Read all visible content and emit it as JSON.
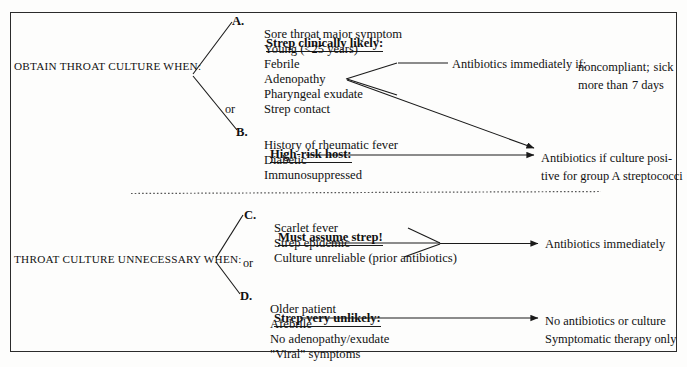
{
  "diagram": {
    "type": "clinical-decision-flowchart",
    "title_visible": false,
    "colors": {
      "ink": "#111111",
      "frame": "#2b2b2b",
      "background": "#fdfdfc",
      "divider": "#555555"
    },
    "left_labels": {
      "top": "OBTAIN THROAT CULTURE WHEN:",
      "bottom": "THROAT CULTURE UNNECESSARY WHEN:"
    },
    "connector_words": {
      "top_or": "or",
      "bottom_or": "or"
    },
    "groups": [
      {
        "id": "A",
        "letter": "A.",
        "heading": "Strep clinically likely:",
        "items": [
          "Sore throat major symptom",
          "Young (<25 years)",
          "Febrile",
          "Adenopathy",
          "Pharyngeal exudate",
          "Strep contact"
        ],
        "outcome_lines": [
          "Antibiotics immediately if:",
          "noncompliant;",
          "sick more than",
          "7 days"
        ]
      },
      {
        "id": "B",
        "letter": "B.",
        "heading": "High-risk host:",
        "items": [
          "History of rheumatic fever",
          "Diabetic",
          "Immunosuppressed"
        ],
        "outcome_lines": [
          "Antibiotics if culture posi-",
          "tive for group A streptococci"
        ]
      },
      {
        "id": "C",
        "letter": "C.",
        "heading": "Must assume strep!",
        "items": [
          "Scarlet fever",
          "Strep epidemic",
          "Culture unreliable (prior antibiotics)"
        ],
        "outcome_lines": [
          "Antibiotics immediately"
        ]
      },
      {
        "id": "D",
        "letter": "D.",
        "heading": "Strep very unlikely:",
        "items": [
          "Older patient",
          "Afebrile",
          "No adenopathy/exudate",
          "\"Viral\" symptoms"
        ],
        "outcome_lines": [
          "No antibiotics or culture",
          "Symptomatic therapy only"
        ]
      }
    ]
  }
}
